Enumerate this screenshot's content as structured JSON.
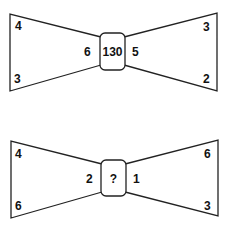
{
  "puzzle": {
    "bowties": [
      {
        "left_top": "4",
        "left_bottom": "3",
        "left_inner": "6",
        "center": "130",
        "right_inner": "5",
        "right_top": "3",
        "right_bottom": "2"
      },
      {
        "left_top": "4",
        "left_bottom": "6",
        "left_inner": "2",
        "center": "?",
        "right_inner": "1",
        "right_top": "6",
        "right_bottom": "3"
      }
    ]
  }
}
